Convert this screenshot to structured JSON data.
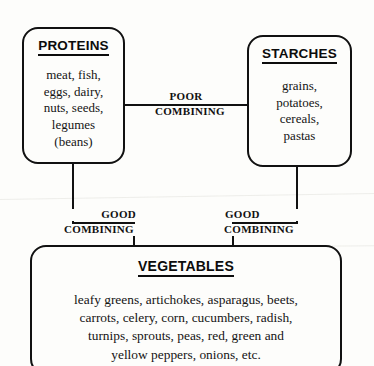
{
  "diagram": {
    "background_color": "#fdfdfb",
    "line_color": "#111111",
    "text_color": "#141414"
  },
  "boxes": {
    "proteins": {
      "title": "PROTEINS",
      "lines": [
        "meat, fish,",
        "eggs, dairy,",
        "nuts, seeds,",
        "legumes",
        "(beans)"
      ]
    },
    "starches": {
      "title": "STARCHES",
      "lines": [
        "grains,",
        "potatoes,",
        "cereals,",
        "pastas"
      ]
    },
    "vegetables": {
      "title": "VEGETABLES",
      "lines": [
        "leafy greens, artichokes, asparagus, beets,",
        "carrots, celery, corn, cucumbers, radish,",
        "turnips, sprouts, peas, red, green and",
        "yellow peppers, onions, etc."
      ]
    }
  },
  "connectors": {
    "poor": {
      "word_top": "POOR",
      "word_bottom": "COMBINING",
      "from": "proteins",
      "to": "starches"
    },
    "good_left": {
      "word_top": "GOOD",
      "word_bottom": "COMBINING",
      "from": "proteins",
      "to": "vegetables"
    },
    "good_right": {
      "word_top": "GOOD",
      "word_bottom": "COMBINING",
      "from": "starches",
      "to": "vegetables"
    }
  }
}
